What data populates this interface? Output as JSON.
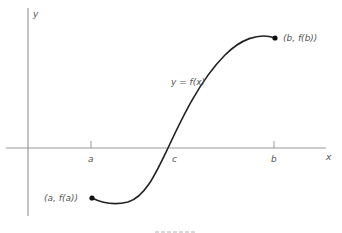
{
  "diagram": {
    "colors": {
      "axis": "#9a9a9a",
      "curve": "#222222",
      "label": "#555555",
      "point": "#111111"
    },
    "axes": {
      "x_label": "x",
      "y_label": "y"
    },
    "ticks": [
      {
        "id": "a",
        "label": "a"
      },
      {
        "id": "c",
        "label": "c"
      },
      {
        "id": "b",
        "label": "b"
      }
    ],
    "curve_label": "y = f(x)",
    "points": [
      {
        "id": "start",
        "label": "(a, f(a))"
      },
      {
        "id": "end",
        "label": "(b, f(b))"
      }
    ]
  }
}
